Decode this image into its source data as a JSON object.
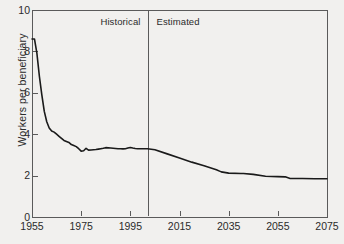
{
  "chart_data": {
    "type": "line",
    "title": "",
    "xlabel": "",
    "ylabel": "Workers per beneficiary",
    "xlim": [
      1955,
      2075
    ],
    "ylim": [
      0,
      10
    ],
    "xticks": [
      1955,
      1975,
      1995,
      2015,
      2035,
      2055,
      2075
    ],
    "yticks": [
      0,
      2,
      4,
      6,
      8,
      10
    ],
    "grid": false,
    "legend": "none",
    "annotations": [
      {
        "text": "Historical",
        "x": 1985,
        "y": 9.4,
        "align": "right-of-divider"
      },
      {
        "text": "Estimated",
        "x": 2010,
        "y": 9.4,
        "align": "left-of-divider"
      }
    ],
    "divider": {
      "x": 2002,
      "label": "historical-estimated-divider"
    },
    "series": [
      {
        "name": "Workers per beneficiary",
        "color": "#1a1a1a",
        "x": [
          1955,
          1956,
          1957,
          1958,
          1959,
          1960,
          1961,
          1962,
          1963,
          1964,
          1965,
          1966,
          1967,
          1968,
          1969,
          1970,
          1971,
          1972,
          1973,
          1974,
          1975,
          1976,
          1977,
          1978,
          1979,
          1980,
          1981,
          1982,
          1983,
          1984,
          1985,
          1986,
          1987,
          1988,
          1989,
          1990,
          1991,
          1992,
          1993,
          1994,
          1995,
          1996,
          1997,
          1998,
          1999,
          2000,
          2001,
          2002,
          2005,
          2010,
          2015,
          2020,
          2025,
          2030,
          2032,
          2035,
          2040,
          2041,
          2045,
          2050,
          2055,
          2058,
          2060,
          2065,
          2070,
          2075
        ],
        "y": [
          8.6,
          8.6,
          7.9,
          6.8,
          5.9,
          5.1,
          4.6,
          4.3,
          4.15,
          4.1,
          4.0,
          3.9,
          3.8,
          3.7,
          3.65,
          3.6,
          3.5,
          3.45,
          3.4,
          3.3,
          3.18,
          3.2,
          3.32,
          3.23,
          3.24,
          3.25,
          3.26,
          3.28,
          3.3,
          3.32,
          3.35,
          3.34,
          3.33,
          3.32,
          3.31,
          3.3,
          3.3,
          3.29,
          3.3,
          3.33,
          3.36,
          3.33,
          3.31,
          3.3,
          3.3,
          3.3,
          3.3,
          3.3,
          3.25,
          3.05,
          2.85,
          2.65,
          2.48,
          2.28,
          2.18,
          2.12,
          2.1,
          2.1,
          2.06,
          1.97,
          1.95,
          1.94,
          1.86,
          1.86,
          1.85,
          1.85
        ]
      }
    ]
  },
  "plot_area": {
    "left": 32,
    "top": 10,
    "right": 327,
    "bottom": 217
  },
  "colors": {
    "background": "#f1f0ee",
    "axis": "#5a5a5a",
    "line": "#1a1a1a",
    "text": "#2b2b2b"
  }
}
